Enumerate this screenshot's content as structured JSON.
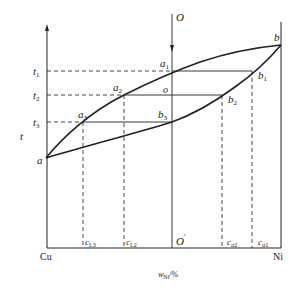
{
  "diagram": {
    "y_axis_label": "t",
    "x_axis_label_main": "w",
    "x_axis_label_sub": "Ni",
    "x_axis_label_unit": "/%",
    "left_component": "Cu",
    "right_component": "Ni",
    "temperatures": [
      {
        "label": "t",
        "sub": "1"
      },
      {
        "label": "t",
        "sub": "2"
      },
      {
        "label": "t",
        "sub": "3"
      }
    ],
    "points": {
      "a": "a",
      "b": "b",
      "a1": {
        "label": "a",
        "sub": "1"
      },
      "a2": {
        "label": "a",
        "sub": "2"
      },
      "a3": {
        "label": "a",
        "sub": "3"
      },
      "b1": {
        "label": "b",
        "sub": "1"
      },
      "b2": {
        "label": "b",
        "sub": "2"
      },
      "b3": {
        "label": "b",
        "sub": "3"
      },
      "o": "o",
      "O": "O",
      "O_prime": "O",
      "O_prime_mark": "′"
    },
    "compositions": [
      {
        "label": "c",
        "sub": "L3"
      },
      {
        "label": "c",
        "sub": "L2"
      },
      {
        "label": "c",
        "sub": "α2"
      },
      {
        "label": "c",
        "sub": "α1"
      }
    ],
    "colors": {
      "line": "#222222",
      "dashed": "#333333",
      "background": "#ffffff"
    }
  }
}
